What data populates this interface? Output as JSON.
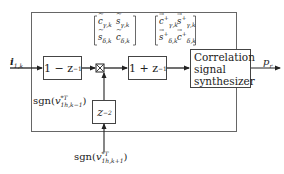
{
  "diagram": {
    "input": {
      "symbol": "i",
      "subscript": "1,k"
    },
    "output": {
      "symbol": "p",
      "subscript": "r"
    },
    "blocks": {
      "diff": {
        "text_main": "1 − z",
        "text_sup": "−1"
      },
      "sum": {
        "text_main": "1 + z",
        "text_sup": "−1"
      },
      "delay": {
        "text_main": "z",
        "text_sup": "−2"
      },
      "synth": {
        "line1": "Correlation",
        "line2": "signal",
        "line3": "synthesizer"
      }
    },
    "multiplier": {
      "symbol": "⊠"
    },
    "matrix_left": {
      "c_gamma": {
        "sym": "c",
        "accent": "~",
        "sub": "γ,k"
      },
      "s_gamma": {
        "sym": "s",
        "accent": "~",
        "sub": "γ,k"
      },
      "s_delta": {
        "sym": "s",
        "accent": "~",
        "sub": "δ,k"
      },
      "c_delta": {
        "sym": "c",
        "accent": "~",
        "sub": "δ,k"
      }
    },
    "matrix_right": {
      "c_gamma": {
        "sym": "c",
        "accent": "→",
        "sup": "+",
        "sub": "γ,k"
      },
      "s_gamma": {
        "sym": "s",
        "accent": "→",
        "sup": "+",
        "sub": "γ,k"
      },
      "s_delta": {
        "sym": "s",
        "accent": "→",
        "sup": "+",
        "sub": "δ,k"
      },
      "c_delta": {
        "sym": "c",
        "accent": "→",
        "sup": "+",
        "sub": "δ,k"
      }
    },
    "sgn_prev": {
      "func": "sgn(",
      "var": "v",
      "sup": "*T",
      "sub": "1h,k−1",
      "close": ")"
    },
    "sgn_next": {
      "func": "sgn(",
      "var": "v",
      "sup": "*T",
      "sub": "1h,k+1",
      "close": ")"
    }
  }
}
